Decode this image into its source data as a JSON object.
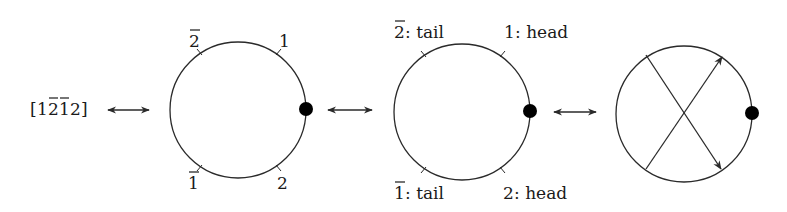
{
  "word": {
    "text": "[1̅2̅1̅2]",
    "open": "[",
    "close": "]",
    "symbols": [
      {
        "digit": "1",
        "bar": false
      },
      {
        "digit": "2",
        "bar": true
      },
      {
        "digit": "1",
        "bar": true
      },
      {
        "digit": "2",
        "bar": false
      }
    ]
  },
  "arrows": [
    "double-arrow",
    "double-arrow",
    "double-arrow"
  ],
  "circle1": {
    "labels": {
      "top_left": {
        "digit": "2",
        "bar": true
      },
      "top_right": {
        "digit": "1",
        "bar": false
      },
      "bottom_left": {
        "digit": "1",
        "bar": true
      },
      "bottom_right": {
        "digit": "2",
        "bar": false
      }
    },
    "basepoint": "filled-dot"
  },
  "circle2": {
    "labels": {
      "top_left": {
        "digit": "2",
        "bar": true,
        "suffix": ": tail"
      },
      "top_right": {
        "digit": "1",
        "bar": false,
        "suffix": ": head"
      },
      "bottom_left": {
        "digit": "1",
        "bar": true,
        "suffix": ": tail"
      },
      "bottom_right": {
        "digit": "2",
        "bar": false,
        "suffix": ": head"
      }
    },
    "basepoint": "filled-dot"
  },
  "circle3": {
    "chords": [
      {
        "from": "upper-left",
        "to": "lower-right",
        "arrow": "lower-right"
      },
      {
        "from": "lower-left",
        "to": "upper-right",
        "arrow": "upper-right"
      }
    ],
    "basepoint": "filled-dot"
  },
  "colors": {
    "stroke": "#2a2a2a",
    "dot": "#000000",
    "background": "#ffffff"
  }
}
